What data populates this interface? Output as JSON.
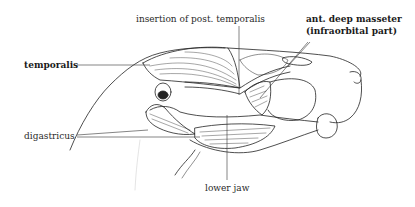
{
  "diagram": {
    "labels": {
      "insertion_post_temporalis": "insertion of post. temporalis",
      "ant_deep_masseter_line1": "ant. deep masseter",
      "ant_deep_masseter_line2": "(infraorbital part)",
      "temporalis": "temporalis",
      "digastricus": "digastricus",
      "lower_jaw": "lower jaw"
    },
    "colors": {
      "background": "#ffffff",
      "ink": "#1a1a1a",
      "stipple": "#cfcfcf"
    }
  }
}
